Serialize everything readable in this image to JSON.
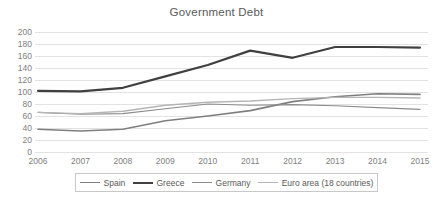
{
  "chart_data": {
    "type": "line",
    "title": "Government Debt",
    "xlabel": "",
    "ylabel": "",
    "x": [
      2006,
      2007,
      2008,
      2009,
      2010,
      2011,
      2012,
      2013,
      2014,
      2015
    ],
    "categories": [
      "2006",
      "2007",
      "2008",
      "2009",
      "2010",
      "2011",
      "2012",
      "2013",
      "2014",
      "2015"
    ],
    "ylim": [
      0,
      200
    ],
    "yticks": [
      0,
      20,
      40,
      60,
      80,
      100,
      120,
      140,
      160,
      180,
      200
    ],
    "ytick_labels": [
      "0",
      "20",
      "40",
      "60",
      "80",
      "100",
      "120",
      "140",
      "160",
      "180",
      "200"
    ],
    "grid": true,
    "grid_axis": "y",
    "legend_position": "bottom",
    "series": [
      {
        "name": "Spain",
        "color": "#7f7f7f",
        "width": 1.6,
        "values": [
          38,
          35,
          38,
          52,
          60,
          69,
          84,
          92,
          97,
          96
        ]
      },
      {
        "name": "Greece",
        "color": "#404040",
        "width": 2.2,
        "values": [
          102,
          101,
          107,
          126,
          145,
          169,
          157,
          175,
          175,
          174
        ]
      },
      {
        "name": "Germany",
        "color": "#8c8c8c",
        "width": 1.1,
        "values": [
          66,
          63,
          64,
          72,
          80,
          78,
          79,
          77,
          74,
          71
        ]
      },
      {
        "name": "Euro area (18 countries)",
        "color": "#b5b5b5",
        "width": 1.4,
        "values": [
          66,
          64,
          68,
          78,
          83,
          85,
          89,
          91,
          91,
          90
        ]
      }
    ]
  },
  "plot_geometry": {
    "left": 38,
    "right": 420,
    "top": 32,
    "bottom": 152
  },
  "colors": {
    "background": "#ffffff",
    "grid": "#e2e2e2",
    "axis_text": "#808080",
    "title_text": "#595959",
    "legend_border": "#c8c8c8"
  }
}
